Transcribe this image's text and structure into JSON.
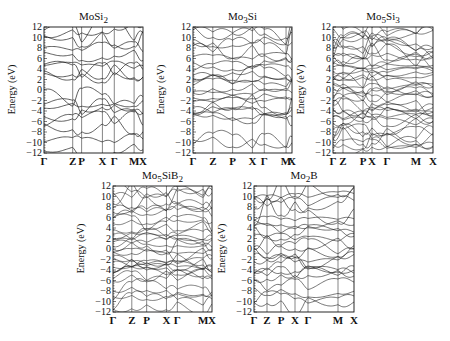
{
  "chart_data": [
    {
      "type": "line",
      "title": "MoSi₂",
      "title_html": "MoSi<sub>2</sub>",
      "ylabel": "Energy (eV)",
      "xlabel": "",
      "ylim": [
        -12,
        12
      ],
      "yticks": [
        12,
        10,
        8,
        6,
        4,
        2,
        0,
        -2,
        -4,
        -6,
        -8,
        -10,
        -12
      ],
      "kpoints": [
        "Γ",
        "Z",
        "P",
        "X",
        "Γ",
        "M",
        "X"
      ],
      "kpos": [
        0,
        0.29,
        0.38,
        0.59,
        0.71,
        0.91,
        1.0
      ],
      "grid": false,
      "density": "sparse",
      "frame": {
        "x": 44,
        "y": 27,
        "w": 99,
        "h": 126
      },
      "band_seeds": [
        -11.5,
        -9.5,
        -6.5,
        -5.5,
        -4.2,
        -3.2,
        -2.8,
        -1.2,
        2.2,
        3.2,
        3.6,
        4.8,
        6.5,
        8.2,
        9.5,
        11.0,
        11.8
      ]
    },
    {
      "type": "line",
      "title": "Mo₃Si",
      "title_html": "Mo<sub>3</sub>Si",
      "ylabel": "Energy (eV)",
      "xlabel": "",
      "ylim": [
        -12,
        12
      ],
      "yticks": [
        12,
        10,
        8,
        6,
        4,
        2,
        0,
        -2,
        -4,
        -6,
        -8,
        -10,
        -12
      ],
      "kpoints": [
        "Γ",
        "Z",
        "P",
        "X",
        "Γ",
        "M",
        "X"
      ],
      "kpos": [
        0,
        0.2,
        0.4,
        0.6,
        0.72,
        0.94,
        1.0
      ],
      "grid": false,
      "density": "medium",
      "frame": {
        "x": 193,
        "y": 27,
        "w": 99,
        "h": 126
      },
      "band_seeds": [
        -10.2,
        -9.3,
        -5.5,
        -5.0,
        -4.2,
        -3.6,
        -2.8,
        -2.0,
        -1.5,
        -0.5,
        0.8,
        1.8,
        2.3,
        2.6,
        3.5,
        4.5,
        5.3,
        6.0,
        7.0,
        8.5,
        9.2,
        10.5,
        11.5
      ]
    },
    {
      "type": "line",
      "title": "Mo₅Si₃",
      "title_html": "Mo<sub>5</sub>Si<sub>3</sub>",
      "ylabel": "Energy (eV)",
      "xlabel": "",
      "ylim": [
        -12,
        12
      ],
      "yticks": [
        12,
        10,
        8,
        6,
        4,
        2,
        0,
        -2,
        -4,
        -6,
        -8,
        -10,
        -12
      ],
      "kpoints": [
        "Γ",
        "Z",
        "P",
        "X",
        "Γ",
        "M",
        "X"
      ],
      "kpos": [
        0,
        0.1,
        0.3,
        0.39,
        0.54,
        0.83,
        1.0
      ],
      "grid": false,
      "density": "dense",
      "frame": {
        "x": 333,
        "y": 27,
        "w": 100,
        "h": 126
      },
      "band_seeds": [
        -11.0,
        -10.3,
        -9.6,
        -9.0,
        -8.4,
        -7.6,
        -6.8,
        -6.0,
        -5.2,
        -4.8,
        -4.3,
        -3.8,
        -3.3,
        -2.8,
        -2.3,
        -1.8,
        -1.2,
        -0.6,
        0.0,
        0.6,
        1.2,
        1.8,
        2.4,
        3.0,
        3.6,
        4.2,
        4.8,
        5.4,
        6.0,
        6.6,
        7.2,
        7.8,
        8.4,
        9.0,
        9.6,
        10.2,
        10.8,
        11.4
      ]
    },
    {
      "type": "line",
      "title": "Mo₅SiB₂",
      "title_html": "Mo<sub>5</sub>SiB<sub>2</sub>",
      "ylabel": "Energy (eV)",
      "xlabel": "",
      "ylim": [
        -12,
        12
      ],
      "yticks": [
        12,
        10,
        8,
        6,
        4,
        2,
        0,
        -2,
        -4,
        -6,
        -8,
        -10,
        -12
      ],
      "kpoints": [
        "Γ",
        "Z",
        "P",
        "X",
        "Γ",
        "M",
        "X"
      ],
      "kpos": [
        0,
        0.19,
        0.34,
        0.54,
        0.65,
        0.91,
        1.0
      ],
      "grid": false,
      "density": "dense",
      "frame": {
        "x": 113,
        "y": 186,
        "w": 99,
        "h": 126
      },
      "band_seeds": [
        -10.8,
        -10.0,
        -9.4,
        -8.2,
        -7.5,
        -5.8,
        -5.2,
        -4.6,
        -4.1,
        -3.7,
        -3.3,
        -2.9,
        -2.4,
        -1.8,
        -1.0,
        -0.3,
        0.2,
        0.7,
        1.3,
        2.0,
        2.7,
        3.4,
        4.2,
        5.0,
        5.8,
        6.6,
        7.4,
        8.2,
        9.0,
        9.8,
        10.6,
        11.4
      ]
    },
    {
      "type": "line",
      "title": "Mo₂B",
      "title_html": "Mo<sub>2</sub>B",
      "ylabel": "Energy (eV)",
      "xlabel": "",
      "ylim": [
        -12,
        12
      ],
      "yticks": [
        12,
        10,
        8,
        6,
        4,
        2,
        0,
        -2,
        -4,
        -6,
        -8,
        -10,
        -12
      ],
      "kpoints": [
        "Γ",
        "Z",
        "P",
        "X",
        "Γ",
        "M",
        "X"
      ],
      "kpos": [
        0,
        0.13,
        0.27,
        0.41,
        0.54,
        0.84,
        1.0
      ],
      "grid": false,
      "density": "medium",
      "frame": {
        "x": 254,
        "y": 186,
        "w": 100,
        "h": 126
      },
      "band_seeds": [
        -10.5,
        -9.2,
        -8.3,
        -6.8,
        -5.3,
        -4.5,
        -3.8,
        -3.2,
        -2.4,
        -1.5,
        -0.6,
        0.4,
        1.3,
        2.2,
        3.0,
        3.8,
        4.8,
        6.0,
        7.5,
        8.5,
        9.5,
        10.5,
        11.5
      ]
    }
  ]
}
